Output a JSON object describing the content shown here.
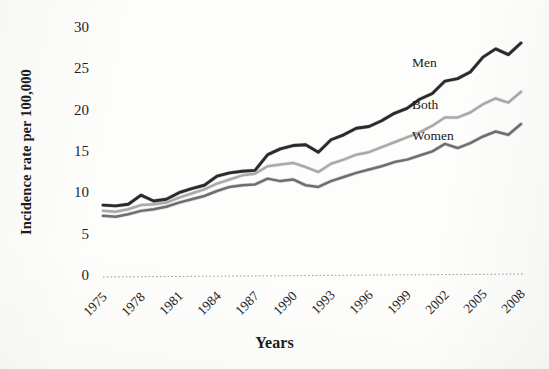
{
  "chart_data": {
    "type": "line",
    "title": "",
    "xlabel": "Years",
    "ylabel": "Incidence rate per 100,000",
    "xlim": [
      1975,
      2008
    ],
    "ylim": [
      0,
      30
    ],
    "ytick_step": 5,
    "xtick_step": 3,
    "grid": false,
    "legend_position": "inline-right",
    "yticks": [
      "0",
      "5",
      "10",
      "15",
      "20",
      "25",
      "30"
    ],
    "xticks": [
      "1975",
      "1978",
      "1981",
      "1984",
      "1987",
      "1990",
      "1993",
      "1996",
      "1999",
      "2002",
      "2005",
      "2008"
    ],
    "x": [
      1975,
      1976,
      1977,
      1978,
      1979,
      1980,
      1981,
      1982,
      1983,
      1984,
      1985,
      1986,
      1987,
      1988,
      1989,
      1990,
      1991,
      1992,
      1993,
      1994,
      1995,
      1996,
      1997,
      1998,
      1999,
      2000,
      2001,
      2002,
      2003,
      2004,
      2005,
      2006,
      2007,
      2008
    ],
    "series": [
      {
        "name": "Men",
        "color": "#2b2b2b",
        "label_x": 412,
        "label_y": 55,
        "values": [
          8.7,
          8.6,
          8.8,
          9.9,
          9.2,
          9.4,
          10.2,
          10.7,
          11.1,
          12.2,
          12.6,
          12.8,
          12.9,
          14.8,
          15.5,
          15.9,
          16.0,
          15.1,
          16.6,
          17.2,
          18.0,
          18.2,
          18.9,
          19.8,
          20.4,
          21.5,
          22.2,
          23.7,
          24.0,
          24.8,
          26.6,
          27.6,
          26.9,
          28.3
        ]
      },
      {
        "name": "Both",
        "color": "#a9a9a9",
        "label_x": 412,
        "label_y": 97,
        "values": [
          8.0,
          7.9,
          8.2,
          8.7,
          8.8,
          9.0,
          9.6,
          10.1,
          10.6,
          11.3,
          11.8,
          12.3,
          12.5,
          13.4,
          13.6,
          13.8,
          13.3,
          12.7,
          13.7,
          14.2,
          14.8,
          15.1,
          15.7,
          16.3,
          16.9,
          17.5,
          18.3,
          19.3,
          19.3,
          19.9,
          20.9,
          21.6,
          21.1,
          22.4
        ]
      },
      {
        "name": "Women",
        "color": "#6e6e6e",
        "label_x": 412,
        "label_y": 128,
        "values": [
          7.4,
          7.3,
          7.6,
          8.0,
          8.2,
          8.5,
          9.0,
          9.4,
          9.8,
          10.4,
          10.9,
          11.1,
          11.2,
          11.9,
          11.6,
          11.8,
          11.1,
          10.9,
          11.6,
          12.1,
          12.6,
          13.0,
          13.4,
          13.9,
          14.2,
          14.7,
          15.2,
          16.1,
          15.6,
          16.2,
          17.0,
          17.6,
          17.2,
          18.5
        ]
      }
    ]
  },
  "axes": {
    "plot_left": 103,
    "plot_right": 521,
    "plot_top": 29,
    "plot_bottom": 277
  }
}
